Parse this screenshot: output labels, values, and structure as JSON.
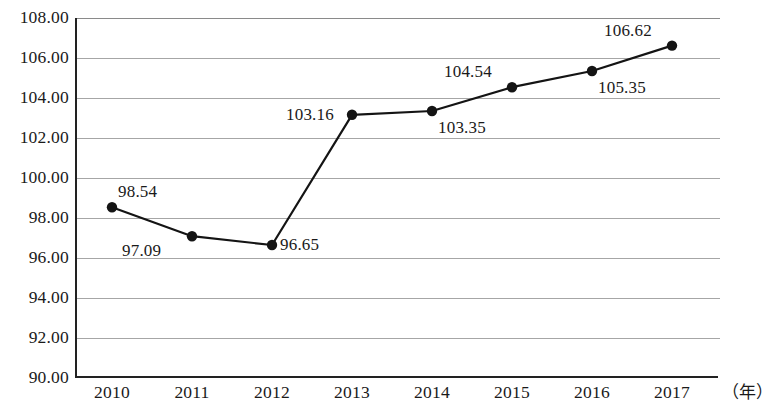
{
  "chart_data": {
    "type": "line",
    "title": "",
    "subtitle": "",
    "xlabel": "（年）",
    "ylabel": "",
    "categories": [
      "2010",
      "2011",
      "2012",
      "2013",
      "2014",
      "2015",
      "2016",
      "2017"
    ],
    "values": [
      98.54,
      97.09,
      96.65,
      103.16,
      103.35,
      104.54,
      105.35,
      106.62
    ],
    "point_labels": [
      "98.54",
      "97.09",
      "96.65",
      "103.16",
      "103.35",
      "104.54",
      "105.35",
      "106.62"
    ],
    "label_positions": [
      "above-right",
      "below-left",
      "right",
      "left",
      "below-right",
      "above-left",
      "below-right",
      "above-left"
    ],
    "ylim": [
      90.0,
      108.0
    ],
    "ytick_step": 2.0,
    "ytick_labels": [
      "108.00",
      "106.00",
      "104.00",
      "102.00",
      "100.00",
      "98.00",
      "96.00",
      "94.00",
      "92.00",
      "90.00"
    ],
    "ytick_values": [
      108.0,
      106.0,
      104.0,
      102.0,
      100.0,
      98.0,
      96.0,
      94.0,
      92.0,
      90.0
    ],
    "grid": "horizontal",
    "legend": "none",
    "series": [
      {
        "name": "",
        "values": [
          98.54,
          97.09,
          96.65,
          103.16,
          103.35,
          104.54,
          105.35,
          106.62
        ],
        "marker": "filled-circle",
        "line_color": "#141414",
        "marker_color": "#141414"
      }
    ],
    "colors": {
      "line": "#141414",
      "marker": "#141414",
      "grid": "#a6a6a6",
      "axis": "#222222",
      "text": "#1a1a1a",
      "background": "#ffffff"
    }
  }
}
